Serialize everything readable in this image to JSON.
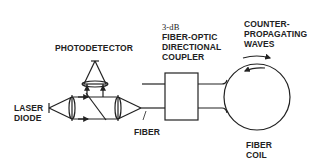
{
  "diagram": {
    "type": "fiber-optic gyroscope schematic",
    "stroke_color": "#222222",
    "background": "#ffffff"
  },
  "labels": {
    "photodetector": "PHOTODETECTOR",
    "laser_diode": [
      "LASER",
      "DIODE"
    ],
    "fiber": "FIBER",
    "coupler": [
      "3-dB",
      "FIBER-OPTIC",
      "DIRECTIONAL",
      "COUPLER"
    ],
    "waves": [
      "COUNTER-",
      "PROPAGATING",
      "WAVES"
    ],
    "fiber_coil": [
      "FIBER",
      "COIL"
    ]
  },
  "components": [
    {
      "id": "laser-diode",
      "label": "LASER DIODE"
    },
    {
      "id": "collimating-lens",
      "label": ""
    },
    {
      "id": "beam-splitter",
      "label": ""
    },
    {
      "id": "focusing-lens",
      "label": ""
    },
    {
      "id": "photodetector",
      "label": "PHOTODETECTOR"
    },
    {
      "id": "detector-lens",
      "label": ""
    },
    {
      "id": "fiber",
      "label": "FIBER"
    },
    {
      "id": "directional-coupler",
      "label": "3-dB FIBER-OPTIC DIRECTIONAL COUPLER"
    },
    {
      "id": "fiber-coil",
      "label": "FIBER COIL"
    }
  ]
}
